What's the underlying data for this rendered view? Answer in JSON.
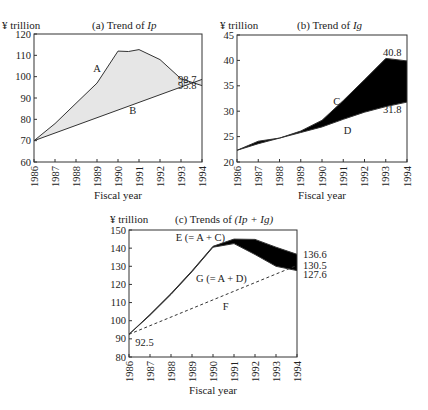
{
  "figure": {
    "unit_label": "¥ trillion",
    "xlabel": "Fiscal year"
  },
  "chart_data": [
    {
      "id": "a",
      "type": "line",
      "title": "(a) Trend of Ip",
      "title_prefix": "(a) Trend of ",
      "title_var": "Ip",
      "xlabel": "Fiscal year",
      "ylabel": "¥ trillion",
      "x": [
        1986,
        1987,
        1988,
        1989,
        1990,
        1991,
        1992,
        1993,
        1994
      ],
      "ylim": [
        60,
        120
      ],
      "yticks": [
        60,
        70,
        80,
        90,
        100,
        110,
        120
      ],
      "series": [
        {
          "name": "A",
          "style": "solid",
          "x": [
            1986,
            1987,
            1988,
            1989,
            1990,
            1990.5,
            1991,
            1992,
            1993,
            1994
          ],
          "values": [
            70,
            78,
            87.5,
            97,
            112,
            111.8,
            112.7,
            108,
            99,
            95.8
          ]
        },
        {
          "name": "B",
          "style": "solid",
          "x": [
            1986,
            1994
          ],
          "values": [
            70,
            98.7
          ]
        }
      ],
      "fill_between": {
        "series": [
          "A",
          "B"
        ],
        "color": "#e6e6e6"
      },
      "annotations": [
        {
          "text": "A",
          "x": 1989,
          "y": 104
        },
        {
          "text": "B",
          "x": 1990.7,
          "y": 84
        },
        {
          "text": "98.7",
          "x": 1994,
          "y": 98.7
        },
        {
          "text": "95.8",
          "x": 1994,
          "y": 95.8
        }
      ]
    },
    {
      "id": "b",
      "type": "line",
      "title": "(b) Trend of Ig",
      "title_prefix": "(b) Trend of ",
      "title_var": "Ig",
      "xlabel": "Fiscal year",
      "ylabel": "¥ trillion",
      "x": [
        1986,
        1987,
        1988,
        1989,
        1990,
        1991,
        1992,
        1993,
        1994
      ],
      "ylim": [
        20,
        45
      ],
      "yticks": [
        20,
        25,
        30,
        35,
        40,
        45
      ],
      "series": [
        {
          "name": "C",
          "style": "solid",
          "values": [
            22.3,
            24.1,
            24.7,
            26.1,
            28.2,
            32.1,
            36.2,
            40.4,
            39.9
          ]
        },
        {
          "name": "D",
          "style": "solid",
          "values": [
            22.3,
            23.6,
            24.7,
            25.8,
            26.9,
            28.4,
            29.8,
            30.9,
            31.8
          ]
        }
      ],
      "fill_between": {
        "series": [
          "C",
          "D"
        ],
        "color": "#000000"
      },
      "annotations": [
        {
          "text": "C",
          "x": 1990.7,
          "y": 32
        },
        {
          "text": "D",
          "x": 1991.2,
          "y": 26.2
        },
        {
          "text": "40.8",
          "x": 1994,
          "y": 41.5
        },
        {
          "text": "31.8",
          "x": 1994,
          "y": 30.3
        }
      ]
    },
    {
      "id": "c",
      "type": "line",
      "title": "(c) Trends of (Ip + Ig)",
      "title_prefix": "(c) Trends of ",
      "title_var": "(Ip + Ig)",
      "xlabel": "Fiscal year",
      "ylabel": "¥ trillion",
      "x": [
        1986,
        1987,
        1988,
        1989,
        1990,
        1991,
        1992,
        1993,
        1994
      ],
      "ylim": [
        80,
        150
      ],
      "yticks": [
        80,
        90,
        100,
        110,
        120,
        130,
        140,
        150
      ],
      "series": [
        {
          "name": "E (= A + C)",
          "style": "solid",
          "values": [
            92.5,
            103.5,
            115,
            127.5,
            141,
            145,
            144.8,
            140.5,
            136.6
          ]
        },
        {
          "name": "G (= A + D)",
          "style": "solid",
          "values": [
            92.5,
            103,
            114.5,
            127,
            140.5,
            142.5,
            136.5,
            130,
            127.6
          ]
        },
        {
          "name": "F",
          "style": "dashed",
          "x": [
            1986,
            1994
          ],
          "values": [
            92.5,
            130.5
          ]
        }
      ],
      "fill_between": {
        "series": [
          "E (= A + D)",
          "G (= A + D)"
        ],
        "color": "#000000"
      },
      "annotations": [
        {
          "text": "E (= A + C)",
          "x": 1989.4,
          "y": 146
        },
        {
          "text": "G (= A + D)",
          "x": 1990.4,
          "y": 123.5
        },
        {
          "text": "F",
          "x": 1990.6,
          "y": 108
        },
        {
          "text": "92.5",
          "x": 1986.3,
          "y": 88
        },
        {
          "text": "136.6",
          "x": 1994,
          "y": 136.6
        },
        {
          "text": "130.5",
          "x": 1994,
          "y": 130.5
        },
        {
          "text": "127.6",
          "x": 1994,
          "y": 125.5
        }
      ]
    }
  ]
}
